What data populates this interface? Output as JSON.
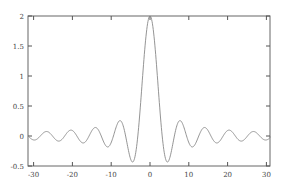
{
  "chart_data": {
    "type": "line",
    "title": "",
    "xlabel": "",
    "ylabel": "",
    "xlim": [
      -31.4,
      31.4
    ],
    "ylim": [
      -0.5,
      2
    ],
    "grid": false,
    "legend": null,
    "xticks": [
      -30,
      -20,
      -10,
      0,
      10,
      20,
      30
    ],
    "xtick_labels": [
      "-30",
      "-20",
      "-10",
      "0",
      "10",
      "20",
      "30"
    ],
    "yticks": [
      -0.5,
      0,
      0.5,
      1,
      1.5,
      2
    ],
    "ytick_labels": [
      "-0.5",
      "0",
      "0.5",
      "1",
      "1.5",
      "2"
    ],
    "series": [
      {
        "name": "2*sin(x)/x",
        "color": "#888888",
        "x": [
          -31.4,
          -30.4,
          -29.4,
          -28.4,
          -27.4,
          -26.4,
          -25.4,
          -24.4,
          -23.4,
          -22.4,
          -21.4,
          -20.4,
          -19.4,
          -18.4,
          -17.4,
          -16.4,
          -15.4,
          -14.4,
          -13.4,
          -12.4,
          -11.4,
          -10.4,
          -9.4,
          -8.4,
          -7.4,
          -6.4,
          -5.4,
          -4.4,
          -3.4,
          -2.4,
          -1.4,
          -0.4,
          0,
          0.4,
          1.4,
          2.4,
          3.4,
          4.4,
          5.4,
          6.4,
          7.4,
          8.4,
          9.4,
          10.4,
          11.4,
          12.4,
          13.4,
          14.4,
          15.4,
          16.4,
          17.4,
          18.4,
          19.4,
          20.4,
          21.4,
          22.4,
          23.4,
          24.4,
          25.4,
          26.4,
          27.4,
          28.4,
          29.4,
          30.4,
          31.4
        ],
        "y": [
          0.0,
          0.053,
          0.063,
          0.009,
          -0.056,
          -0.072,
          -0.027,
          0.053,
          0.081,
          0.036,
          -0.051,
          -0.099,
          -0.054,
          0.044,
          0.112,
          0.085,
          -0.036,
          -0.135,
          -0.116,
          0.0,
          0.164,
          0.176,
          0.014,
          -0.203,
          -0.243,
          0.037,
          0.286,
          0.433,
          -0.377,
          0.524,
          1.407,
          1.947,
          2.0,
          1.947,
          1.407,
          0.524,
          -0.377,
          -0.433,
          -0.286,
          0.037,
          0.243,
          0.203,
          0.014,
          -0.176,
          -0.164,
          0.0,
          0.116,
          0.135,
          0.036,
          -0.085,
          -0.112,
          -0.044,
          0.054,
          0.099,
          0.051,
          -0.036,
          -0.081,
          -0.053,
          0.027,
          0.072,
          0.056,
          -0.009,
          -0.063,
          -0.053,
          0.0
        ]
      }
    ]
  }
}
